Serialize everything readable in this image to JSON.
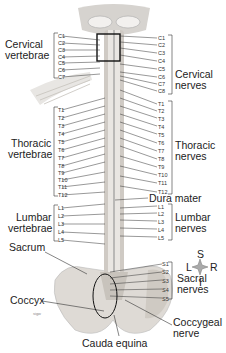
{
  "figure": {
    "left_labels": {
      "cervical_vertebrae": [
        "Cervical",
        "vertebrae"
      ],
      "thoracic_vertebrae": [
        "Thoracic",
        "vertebrae"
      ],
      "lumbar_vertebrae": [
        "Lumbar",
        "vertebrae"
      ],
      "sacrum": "Sacrum",
      "coccyx": "Coccyx"
    },
    "right_labels": {
      "cervical_nerves": [
        "Cervical",
        "nerves"
      ],
      "thoracic_nerves": [
        "Thoracic",
        "nerves"
      ],
      "dura_mater": "Dura mater",
      "lumbar_nerves": [
        "Lumbar",
        "nerves"
      ],
      "sacral_nerves": [
        "Sacral",
        "nerves"
      ],
      "coccygeal_nerve": [
        "Coccygeal",
        "nerve"
      ]
    },
    "bottom_label": "Cauda equina",
    "left_ticks": {
      "cervical": [
        "C1",
        "C2",
        "C3",
        "C4",
        "C5",
        "C6",
        "C7"
      ],
      "thoracic": [
        "T1",
        "T2",
        "T3",
        "T4",
        "T5",
        "T6",
        "T7",
        "T8",
        "T9",
        "T10",
        "T11",
        "T12"
      ],
      "lumbar": [
        "L1",
        "L2",
        "L3",
        "L4",
        "L5"
      ]
    },
    "right_ticks": {
      "cervical": [
        "C1",
        "C2",
        "C3",
        "C4",
        "C5",
        "C6",
        "C7",
        "C8"
      ],
      "thoracic": [
        "T1",
        "T2",
        "T3",
        "T4",
        "T5",
        "T6",
        "T7",
        "T8",
        "T9",
        "T10",
        "T11",
        "T12"
      ],
      "lumbar": [
        "L1",
        "L2",
        "L3",
        "L4",
        "L5"
      ],
      "sacral": [
        "S1",
        "S2",
        "S3",
        "S4",
        "S5"
      ]
    },
    "compass": {
      "top": "S",
      "left": "L",
      "right": "R",
      "bottom": "I"
    },
    "watermark": "sigw"
  }
}
